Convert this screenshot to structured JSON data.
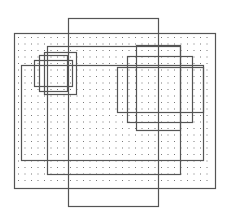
{
  "diagram": {
    "type": "overlapping-rectangles",
    "background": "#ffffff",
    "stroke_color": "#555555",
    "dot_color": "#777777",
    "dotted_region": {
      "x": 14,
      "y": 33,
      "w": 201,
      "h": 155,
      "dot_spacing": 6.5
    },
    "rectangles": [
      {
        "id": "outer-dotted",
        "x": 14,
        "y": 33,
        "w": 201,
        "h": 155
      },
      {
        "id": "tall",
        "x": 68,
        "y": 18,
        "w": 90,
        "h": 188
      },
      {
        "id": "large-a",
        "x": 47,
        "y": 46,
        "w": 133,
        "h": 128
      },
      {
        "id": "large-b",
        "x": 21,
        "y": 65,
        "w": 182,
        "h": 95
      },
      {
        "id": "left-small-1",
        "x": 34,
        "y": 60,
        "w": 38,
        "h": 26
      },
      {
        "id": "left-small-2",
        "x": 39,
        "y": 55,
        "w": 28,
        "h": 36
      },
      {
        "id": "left-small-3",
        "x": 44,
        "y": 52,
        "w": 32,
        "h": 42
      },
      {
        "id": "right-small-1",
        "x": 117,
        "y": 67,
        "w": 86,
        "h": 45
      },
      {
        "id": "right-small-2",
        "x": 127,
        "y": 56,
        "w": 65,
        "h": 66
      },
      {
        "id": "right-small-3",
        "x": 136,
        "y": 45,
        "w": 44,
        "h": 85
      }
    ]
  }
}
